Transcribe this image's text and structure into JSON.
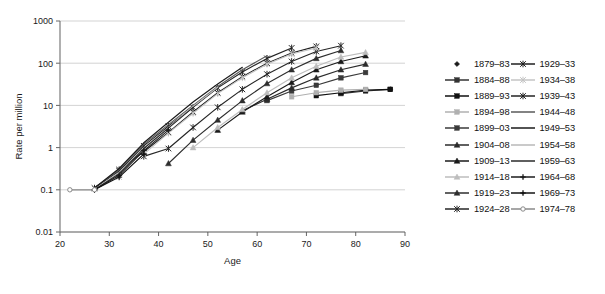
{
  "chart_data": {
    "type": "line",
    "title": "",
    "xlabel": "Age",
    "ylabel": "Rate per million",
    "yscale": "log",
    "xlim": [
      20,
      90
    ],
    "ylim": [
      0.01,
      1000
    ],
    "xticks": [
      20,
      30,
      40,
      50,
      60,
      70,
      80,
      90
    ],
    "yticks": [
      0.01,
      0.1,
      1,
      10,
      100,
      1000
    ],
    "yticklabels": [
      "0.01",
      "0.1",
      "1",
      "10",
      "100",
      "1000"
    ],
    "grid": "horizontal",
    "legend_position": "right",
    "legend_columns": 2,
    "series": [
      {
        "name": "1879–83",
        "color": "#1a1a1a",
        "marker": "diamond",
        "line": false,
        "x": [
          87
        ],
        "y": [
          24
        ]
      },
      {
        "name": "1884–88",
        "color": "#333333",
        "marker": "square",
        "line": true,
        "x": [
          77,
          82,
          87
        ],
        "y": [
          19,
          22,
          24
        ]
      },
      {
        "name": "1889–93",
        "color": "#111111",
        "marker": "square-filled",
        "line": true,
        "x": [
          72,
          77,
          82,
          87
        ],
        "y": [
          17,
          20,
          23,
          24
        ]
      },
      {
        "name": "1894–98",
        "color": "#b0b0b0",
        "marker": "square-grey",
        "line": true,
        "x": [
          67,
          72,
          77,
          82
        ],
        "y": [
          16,
          20,
          23,
          24
        ]
      },
      {
        "name": "1899–03",
        "color": "#3a3a3a",
        "marker": "square-filled",
        "line": true,
        "x": [
          62,
          67,
          72,
          77,
          82
        ],
        "y": [
          13,
          22,
          30,
          45,
          60
        ]
      },
      {
        "name": "1904–08",
        "color": "#2b2b2b",
        "marker": "triangle",
        "line": true,
        "x": [
          57,
          62,
          67,
          72,
          77,
          82
        ],
        "y": [
          7.5,
          14,
          26,
          45,
          70,
          95
        ]
      },
      {
        "name": "1909–13",
        "color": "#1a1a1a",
        "marker": "triangle-filled",
        "line": true,
        "x": [
          52,
          57,
          62,
          67,
          72,
          77,
          82
        ],
        "y": [
          2.6,
          7,
          16,
          35,
          70,
          110,
          150
        ]
      },
      {
        "name": "1914–18",
        "color": "#bdbdbd",
        "marker": "triangle-grey",
        "line": true,
        "x": [
          47,
          52,
          57,
          62,
          67,
          72,
          77,
          82
        ],
        "y": [
          1.0,
          3.0,
          8,
          20,
          45,
          85,
          140,
          180
        ]
      },
      {
        "name": "1919–23",
        "color": "#2e2e2e",
        "marker": "triangle-filled",
        "line": true,
        "x": [
          42,
          47,
          52,
          57,
          62,
          67,
          72,
          77
        ],
        "y": [
          0.42,
          1.5,
          4.5,
          13,
          33,
          70,
          130,
          200
        ]
      },
      {
        "name": "1924–28",
        "color": "#262626",
        "marker": "star",
        "line": true,
        "x": [
          37,
          42,
          47,
          52,
          57,
          62,
          67,
          72,
          77
        ],
        "y": [
          0.62,
          0.95,
          3.0,
          9,
          24,
          55,
          110,
          190,
          260
        ]
      },
      {
        "name": "1929–33",
        "color": "#1f1f1f",
        "marker": "star",
        "line": true,
        "x": [
          32,
          37,
          42,
          47,
          52,
          57,
          62,
          67,
          72
        ],
        "y": [
          0.3,
          0.8,
          2.3,
          7,
          20,
          48,
          100,
          175,
          250
        ]
      },
      {
        "name": "1934–38",
        "color": "#c4c4c4",
        "marker": "star-grey",
        "line": true,
        "x": [
          32,
          37,
          42,
          47,
          52,
          57,
          62,
          67,
          72
        ],
        "y": [
          0.2,
          0.7,
          2.2,
          6.5,
          19,
          45,
          95,
          165,
          230
        ]
      },
      {
        "name": "1939–43",
        "color": "#232323",
        "marker": "star",
        "line": true,
        "x": [
          27,
          32,
          37,
          42,
          47,
          52,
          57,
          62,
          67
        ],
        "y": [
          0.11,
          0.28,
          1.1,
          3.2,
          9,
          26,
          62,
          130,
          230
        ]
      },
      {
        "name": "1944–48",
        "color": "#5a5a5a",
        "marker": "none",
        "line": true,
        "x": [
          27,
          32,
          37,
          42,
          47,
          52,
          57,
          62
        ],
        "y": [
          0.11,
          0.3,
          1.2,
          3.5,
          10,
          28,
          70,
          150
        ]
      },
      {
        "name": "1949–53",
        "color": "#1a1a1a",
        "marker": "none",
        "line": true,
        "x": [
          27,
          32,
          37,
          42,
          47,
          52,
          57
        ],
        "y": [
          0.11,
          0.32,
          1.3,
          4.0,
          12,
          32,
          80
        ]
      },
      {
        "name": "1954–58",
        "color": "#b8b8b8",
        "marker": "none",
        "line": true,
        "x": [
          27,
          32,
          37,
          42,
          47,
          52
        ],
        "y": [
          0.1,
          0.26,
          1.0,
          3.0,
          9.5,
          27
        ]
      },
      {
        "name": "1959–63",
        "color": "#2a2a2a",
        "marker": "none",
        "line": true,
        "x": [
          27,
          32,
          37,
          42,
          47
        ],
        "y": [
          0.1,
          0.24,
          0.95,
          2.9,
          9
        ]
      },
      {
        "name": "1964–68",
        "color": "#1c1c1c",
        "marker": "plus",
        "line": true,
        "x": [
          27,
          32,
          37,
          42
        ],
        "y": [
          0.1,
          0.22,
          0.85,
          2.6
        ]
      },
      {
        "name": "1969–73",
        "color": "#141414",
        "marker": "plus-filled",
        "line": true,
        "x": [
          27,
          32,
          37
        ],
        "y": [
          0.1,
          0.2,
          0.7
        ]
      },
      {
        "name": "1974–78",
        "color": "#8a8a8a",
        "marker": "circle-open",
        "line": true,
        "x": [
          22,
          27
        ],
        "y": [
          0.1,
          0.1
        ]
      }
    ]
  },
  "legend": {
    "left_column": [
      {
        "label": "1879–83"
      },
      {
        "label": "1884–88"
      },
      {
        "label": "1889–93"
      },
      {
        "label": "1894–98"
      },
      {
        "label": "1899–03"
      },
      {
        "label": "1904–08"
      },
      {
        "label": "1909–13"
      },
      {
        "label": "1914–18"
      },
      {
        "label": "1919–23"
      },
      {
        "label": "1924–28"
      }
    ],
    "right_column": [
      {
        "label": "1929–33"
      },
      {
        "label": "1934–38"
      },
      {
        "label": "1939–43"
      },
      {
        "label": "1944–48"
      },
      {
        "label": "1949–53"
      },
      {
        "label": "1954–58"
      },
      {
        "label": "1959–63"
      },
      {
        "label": "1964–68"
      },
      {
        "label": "1969–73"
      },
      {
        "label": "1974–78"
      }
    ]
  }
}
